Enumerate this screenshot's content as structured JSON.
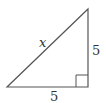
{
  "diagram": {
    "type": "right-triangle",
    "labels": {
      "hypotenuse": "x",
      "vertical_leg": "5",
      "horizontal_leg": "5"
    },
    "colors": {
      "stroke": "#555555",
      "text": "#333333",
      "background": "#ffffff"
    }
  }
}
